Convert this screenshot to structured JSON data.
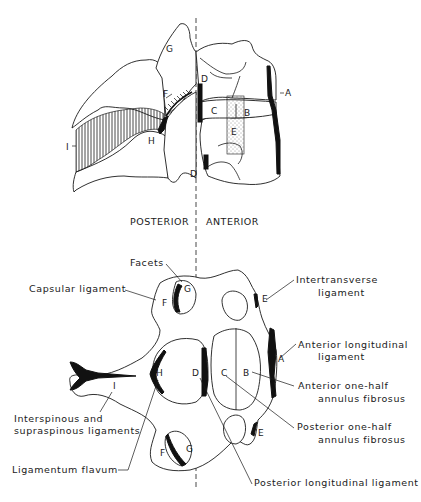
{
  "diagram": {
    "orientation": {
      "posterior_label": "POSTERIOR",
      "anterior_label": "ANTERIOR"
    },
    "lateral_view": {
      "letters": {
        "A": "A",
        "B": "B",
        "C": "C",
        "D_top": "D",
        "D_bottom": "D",
        "E": "E",
        "F": "F",
        "G": "G",
        "H": "H",
        "I": "I"
      }
    },
    "axial_view": {
      "letters": {
        "A": "A",
        "B": "B",
        "C": "C",
        "D": "D",
        "E_top": "E",
        "E_bottom": "E",
        "F_top": "F",
        "G_top": "G",
        "F_bottom": "F",
        "G_bottom": "G",
        "H": "H",
        "I": "I"
      },
      "labels": {
        "facets": "Facets",
        "capsular_ligament": "Capsular ligament",
        "intertransverse_1": "Intertransverse",
        "intertransverse_2": "ligament",
        "anterior_longitudinal_1": "Anterior longitudinal",
        "anterior_longitudinal_2": "ligament",
        "anterior_annulus_1": "Anterior one-half",
        "anterior_annulus_2": "annulus fibrosus",
        "posterior_annulus_1": "Posterior one-half",
        "posterior_annulus_2": "annulus fibrosus",
        "interspinous_1": "Interspinous and",
        "interspinous_2": "supraspinous ligaments",
        "ligamentum_flavum": "Ligamentum flavum",
        "posterior_longitudinal": "Posterior longitudinal ligament"
      }
    }
  }
}
